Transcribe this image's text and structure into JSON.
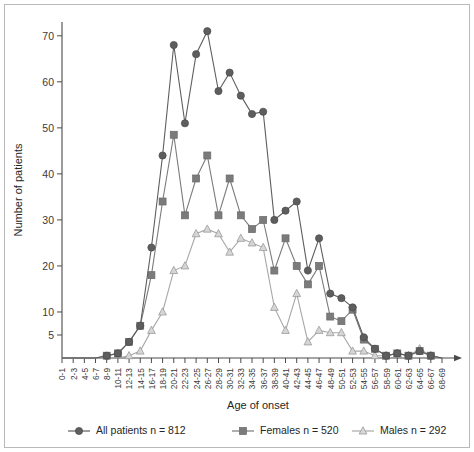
{
  "chart_data": {
    "type": "line",
    "title": "",
    "xlabel": "Age of onset",
    "ylabel": "Number of patients",
    "grid": false,
    "legend_position": "bottom",
    "ylim": [
      0,
      73
    ],
    "yticks": [
      5,
      10,
      20,
      30,
      40,
      50,
      60,
      70
    ],
    "categories": [
      "0-1",
      "2-3",
      "4-5",
      "6-7",
      "8-9",
      "10-11",
      "12-13",
      "14-15",
      "16-17",
      "18-19",
      "20-21",
      "22-23",
      "24-25",
      "26-27",
      "28-29",
      "30-31",
      "32-33",
      "34-35",
      "36-37",
      "38-39",
      "40-41",
      "42-43",
      "44-45",
      "46-47",
      "48-49",
      "50-51",
      "52-53",
      "54-55",
      "56-57",
      "58-59",
      "60-61",
      "62-63",
      "64-65",
      "66-67",
      "68-69"
    ],
    "series": [
      {
        "name": "All patients",
        "legend_label": "All patients  n = 812",
        "n": 812,
        "marker": "circle",
        "color": "#5e5e5e",
        "values": [
          0,
          0,
          0,
          0,
          0.5,
          1,
          3.5,
          7,
          24,
          44,
          68,
          51,
          66,
          71,
          58,
          62,
          57,
          53,
          53.5,
          30,
          32,
          34,
          19,
          26,
          14,
          13,
          11,
          4.5,
          2,
          0.5,
          1,
          0.5,
          1.5,
          0.5,
          0
        ]
      },
      {
        "name": "Females",
        "legend_label": "Females  n = 520",
        "n": 520,
        "marker": "square",
        "color": "#7b7b7b",
        "values": [
          0,
          0,
          0,
          0,
          0.5,
          1,
          3.5,
          7,
          18,
          34,
          48.5,
          31,
          39,
          44,
          31,
          39,
          31,
          28,
          30,
          19,
          26,
          20,
          16,
          20,
          9,
          8,
          10.5,
          4,
          2,
          0.5,
          1,
          0.5,
          1.5,
          0.5,
          0
        ]
      },
      {
        "name": "Males",
        "legend_label": "Males  n = 292",
        "n": 292,
        "marker": "triangle",
        "color": "#a8a8a8",
        "values": [
          0,
          0,
          0,
          0,
          0,
          0,
          0.5,
          1.5,
          6,
          10,
          19,
          20,
          27,
          28,
          27,
          23,
          26,
          25,
          24,
          11,
          6,
          14,
          3.5,
          6,
          5.5,
          5.5,
          1.5,
          1.5,
          0.5,
          0.5,
          1,
          0.5,
          2,
          0.5,
          0
        ]
      }
    ]
  },
  "axis": {
    "y_title": "Number of patients",
    "x_title": "Age of onset"
  },
  "legend": {
    "entries": [
      {
        "label": "All patients  n = 812",
        "marker": "circle",
        "color": "#5e5e5e"
      },
      {
        "label": "Females  n = 520",
        "marker": "square",
        "color": "#7b7b7b"
      },
      {
        "label": "Males  n = 292",
        "marker": "triangle",
        "color": "#a8a8a8"
      }
    ]
  }
}
